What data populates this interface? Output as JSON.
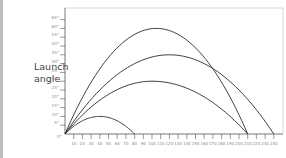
{
  "chart_data": {
    "type": "line",
    "title": "",
    "xlabel": "",
    "ylabel": "Launch angle",
    "origin_label": "0°",
    "y_ticks": [
      "5°",
      "10°",
      "15°",
      "20°",
      "25°",
      "30°",
      "35°",
      "40°",
      "45°",
      "50°",
      "55°",
      "60°",
      "65°"
    ],
    "x_ticks": [
      "10",
      "20",
      "30",
      "40",
      "50",
      "60",
      "70",
      "80",
      "90",
      "100",
      "110",
      "120",
      "130",
      "140",
      "150",
      "160",
      "170",
      "180",
      "190",
      "200",
      "210",
      "220",
      "230",
      "240"
    ],
    "xlim": [
      0,
      250
    ],
    "ylim": [
      0,
      67
    ],
    "grid": false,
    "series": [
      {
        "name": "trajectory-low",
        "range": 80,
        "peak_height": 10,
        "peak_x": 40
      },
      {
        "name": "trajectory-30",
        "range": 210,
        "peak_height": 30,
        "peak_x": 100
      },
      {
        "name": "trajectory-45",
        "range": 240,
        "peak_height": 45,
        "peak_x": 120
      },
      {
        "name": "trajectory-60",
        "range": 210,
        "peak_height": 60,
        "peak_x": 105
      }
    ]
  },
  "labels": {
    "y_title_line1": "Launch",
    "y_title_line2": "angle"
  },
  "colors": {
    "curve": "#2a2a2a",
    "axis": "#555555",
    "frame": "#cfcfcf",
    "strip": "#bdbdbd"
  }
}
